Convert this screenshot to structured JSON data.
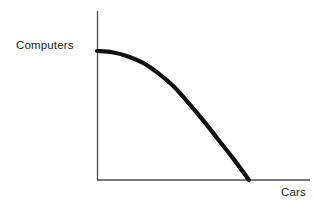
{
  "chart_data": {
    "type": "line",
    "title": "",
    "subtitle": "",
    "xlabel": "Cars",
    "ylabel": "Computers",
    "grid": false,
    "legend": null,
    "annotations": [],
    "axis_color": "#4d4d4d",
    "curve_color": "#111111",
    "background": "#ffffff",
    "xlim": [
      0,
      100
    ],
    "ylim": [
      0,
      100
    ],
    "x_tick_labels": [],
    "y_tick_labels": [],
    "series": [
      {
        "name": "Production possibilities frontier",
        "shape": "concave",
        "x": [
          0,
          10,
          20,
          30,
          40,
          50,
          60,
          70,
          80,
          90,
          100
        ],
        "y": [
          100,
          99,
          96,
          91,
          83,
          73,
          60,
          46,
          31,
          16,
          0
        ]
      }
    ]
  },
  "labels": {
    "y_axis": "Computers",
    "x_axis": "Cars"
  },
  "geometry": {
    "y_axis_x": 97,
    "y_axis_top": 11,
    "x_axis_y": 180,
    "x_axis_right": 310,
    "curve_start": [
      97,
      51
    ],
    "curve_end": [
      249,
      180
    ],
    "curve_width": 4.2,
    "axis_width": 1.1
  }
}
